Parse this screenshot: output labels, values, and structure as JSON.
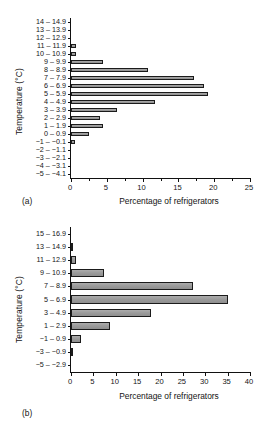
{
  "figure": {
    "panels": [
      {
        "id": "a",
        "panel_label": "(a)",
        "chart_data": {
          "type": "bar",
          "orientation": "horizontal",
          "title": "",
          "xlabel": "Percentage of refrigerators",
          "ylabel": "Temperature (°C)",
          "xlim": [
            0,
            25
          ],
          "xticks": [
            0,
            5,
            10,
            15,
            20,
            25
          ],
          "xticklabels": [
            "0",
            "5",
            "10",
            "15",
            "20",
            "25"
          ],
          "grid": false,
          "legend": null,
          "categories": [
            "14 – 14.9",
            "13 – 13.9",
            "12 – 12.9",
            "11 – 11.9",
            "10 – 10.9",
            "9 – 9.9",
            "8 – 8.9",
            "7 – 7.9",
            "6 – 6.9",
            "5 – 5.9",
            "4 – 4.9",
            "3 – 3.9",
            "2 – 2.9",
            "1 – 1.9",
            "0 – 0.9",
            "−1 – −0.1",
            "−2 – −1.1",
            "−3 – −2.1",
            "−4 – −3.1",
            "−5 – −4.1"
          ],
          "values": [
            0,
            0,
            0,
            0.7,
            0.7,
            4.5,
            10.8,
            17.2,
            18.6,
            19.2,
            11.8,
            6.4,
            4.1,
            4.5,
            2.5,
            0.5,
            0,
            0,
            0,
            0
          ]
        }
      },
      {
        "id": "b",
        "panel_label": "(b)",
        "chart_data": {
          "type": "bar",
          "orientation": "horizontal",
          "title": "",
          "xlabel": "Percentage of refrigerators",
          "ylabel": "Temperature (°C)",
          "xlim": [
            0,
            40
          ],
          "xticks": [
            0,
            5,
            10,
            15,
            20,
            25,
            30,
            35,
            40
          ],
          "xticklabels": [
            "0",
            "5",
            "10",
            "15",
            "20",
            "25",
            "30",
            "35",
            "40"
          ],
          "grid": false,
          "legend": null,
          "categories": [
            "15 – 16.9",
            "13 – 14.9",
            "11 – 12.9",
            "9 – 10.9",
            "7 – 8.9",
            "5 – 6.9",
            "3 – 4.9",
            "1 – 2.9",
            "−1 – 0.9",
            "−3 – −0.9",
            "−5 – −2.9"
          ],
          "values": [
            0,
            0.3,
            1.1,
            7.3,
            27.2,
            35.0,
            17.8,
            8.8,
            2.2,
            0.4,
            0
          ]
        }
      }
    ]
  }
}
